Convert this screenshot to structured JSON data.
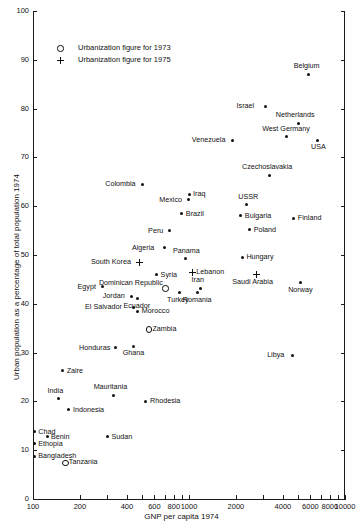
{
  "chart_data": {
    "type": "scatter",
    "title": "",
    "xlabel": "GNP per capita 1974",
    "ylabel": "Urban population as a percentage of total population 1974",
    "xscale": "log",
    "xlim": [
      100,
      10000
    ],
    "ylim": [
      0,
      100
    ],
    "grid": false,
    "xticks": [
      100,
      200,
      400,
      600,
      800,
      1000,
      2000,
      4000,
      6000,
      8000,
      10000
    ],
    "xtick_labels": [
      "100",
      "200",
      "400",
      "600",
      "800",
      "1000",
      "2000",
      "4000",
      "6000",
      "8000",
      "10000"
    ],
    "yticks": [
      0,
      10,
      20,
      30,
      40,
      50,
      60,
      70,
      80,
      90,
      100
    ],
    "ytick_labels": [
      "0",
      "10",
      "20",
      "30",
      "40",
      "50",
      "60",
      "70",
      "80",
      "90",
      "100"
    ],
    "legend": {
      "position": "upper-left-inside",
      "entries": [
        {
          "marker": "circle-open",
          "label": "Urbanization figure for 1973"
        },
        {
          "marker": "plus",
          "label": "Urbanization figure for 1975"
        }
      ]
    },
    "points": [
      {
        "name": "Belgium",
        "x": 5800,
        "y": 87.0,
        "marker": "dot",
        "label_pos": "above"
      },
      {
        "name": "Israel",
        "x": 3100,
        "y": 80.5,
        "marker": "dot",
        "label_pos": "left"
      },
      {
        "name": "Netherlands",
        "x": 5000,
        "y": 77.0,
        "marker": "dot",
        "label_pos": "above"
      },
      {
        "name": "USA",
        "x": 6700,
        "y": 73.5,
        "marker": "dot",
        "label_pos": "below"
      },
      {
        "name": "West Germany",
        "x": 4200,
        "y": 74.2,
        "marker": "dot",
        "label_pos": "above"
      },
      {
        "name": "Venezuela",
        "x": 1900,
        "y": 73.5,
        "marker": "dot",
        "label_pos": "left"
      },
      {
        "name": "Czechoslavakia",
        "x": 3300,
        "y": 66.3,
        "marker": "dot",
        "label_pos": "above"
      },
      {
        "name": "Colombia",
        "x": 500,
        "y": 64.5,
        "marker": "dot",
        "label_pos": "left"
      },
      {
        "name": "Iraq",
        "x": 1000,
        "y": 62.5,
        "marker": "dot",
        "label_pos": "right"
      },
      {
        "name": "Mexico",
        "x": 990,
        "y": 61.3,
        "marker": "dot",
        "label_pos": "left"
      },
      {
        "name": "USSR",
        "x": 2350,
        "y": 60.3,
        "marker": "dot",
        "label_pos": "above"
      },
      {
        "name": "Brazil",
        "x": 900,
        "y": 58.5,
        "marker": "dot",
        "label_pos": "right"
      },
      {
        "name": "Bulgaria",
        "x": 2150,
        "y": 58.0,
        "marker": "dot",
        "label_pos": "right"
      },
      {
        "name": "Finland",
        "x": 4700,
        "y": 57.5,
        "marker": "dot",
        "label_pos": "right"
      },
      {
        "name": "Poland",
        "x": 2450,
        "y": 55.2,
        "marker": "dot",
        "label_pos": "right"
      },
      {
        "name": "Peru",
        "x": 750,
        "y": 55.0,
        "marker": "dot",
        "label_pos": "left"
      },
      {
        "name": "Algeria",
        "x": 700,
        "y": 51.5,
        "marker": "dot",
        "label_pos": "left"
      },
      {
        "name": "Panama",
        "x": 950,
        "y": 49.2,
        "marker": "dot",
        "label_pos": "above"
      },
      {
        "name": "Hungary",
        "x": 2200,
        "y": 49.5,
        "marker": "dot",
        "label_pos": "right"
      },
      {
        "name": "South Korea",
        "x": 480,
        "y": 48.5,
        "marker": "plus",
        "label_pos": "left"
      },
      {
        "name": "Lebanon",
        "x": 1050,
        "y": 46.5,
        "marker": "plus",
        "label_pos": "right"
      },
      {
        "name": "Syria",
        "x": 620,
        "y": 46.0,
        "marker": "dot",
        "label_pos": "right"
      },
      {
        "name": "Saudi Arabia",
        "x": 2700,
        "y": 46.0,
        "marker": "plus",
        "label_pos": "below"
      },
      {
        "name": "Norway",
        "x": 5200,
        "y": 44.3,
        "marker": "dot",
        "label_pos": "below"
      },
      {
        "name": "Egypt",
        "x": 280,
        "y": 43.5,
        "marker": "dot",
        "label_pos": "left"
      },
      {
        "name": "Iran",
        "x": 1180,
        "y": 43.2,
        "marker": "dot",
        "label_pos": "above"
      },
      {
        "name": "Dominican Republic",
        "x": 700,
        "y": 43.2,
        "marker": "circle",
        "label_pos": "left2"
      },
      {
        "name": "Romania",
        "x": 1130,
        "y": 42.3,
        "marker": "dot",
        "label_pos": "below"
      },
      {
        "name": "Turkey",
        "x": 870,
        "y": 42.3,
        "marker": "dot",
        "label_pos": "below"
      },
      {
        "name": "Jordan",
        "x": 430,
        "y": 41.5,
        "marker": "dot",
        "label_pos": "left"
      },
      {
        "name": "Ecuador",
        "x": 470,
        "y": 41.0,
        "marker": "dot",
        "label_pos": "below"
      },
      {
        "name": "El Salvador",
        "x": 440,
        "y": 39.3,
        "marker": "dot",
        "label_pos": "left"
      },
      {
        "name": "Morocco",
        "x": 470,
        "y": 38.5,
        "marker": "dot",
        "label_pos": "right"
      },
      {
        "name": "Zambia",
        "x": 550,
        "y": 34.8,
        "marker": "circle",
        "label_pos": "right"
      },
      {
        "name": "Honduras",
        "x": 340,
        "y": 31.0,
        "marker": "dot",
        "label_pos": "left"
      },
      {
        "name": "Ghana",
        "x": 440,
        "y": 31.3,
        "marker": "dot",
        "label_pos": "below"
      },
      {
        "name": "Libya",
        "x": 4600,
        "y": 29.5,
        "marker": "dot",
        "label_pos": "left"
      },
      {
        "name": "Zaire",
        "x": 155,
        "y": 26.3,
        "marker": "dot",
        "label_pos": "right"
      },
      {
        "name": "Mauritania",
        "x": 330,
        "y": 21.3,
        "marker": "dot",
        "label_pos": "above"
      },
      {
        "name": "India",
        "x": 145,
        "y": 20.5,
        "marker": "dot",
        "label_pos": "above"
      },
      {
        "name": "Rhodesia",
        "x": 530,
        "y": 20.0,
        "marker": "dot",
        "label_pos": "right"
      },
      {
        "name": "Indonesia",
        "x": 170,
        "y": 18.3,
        "marker": "dot",
        "label_pos": "right"
      },
      {
        "name": "Chad",
        "x": 102,
        "y": 13.8,
        "marker": "dot",
        "label_pos": "right"
      },
      {
        "name": "Benin",
        "x": 123,
        "y": 12.8,
        "marker": "dot",
        "label_pos": "right"
      },
      {
        "name": "Sudan",
        "x": 300,
        "y": 12.8,
        "marker": "dot",
        "label_pos": "right"
      },
      {
        "name": "Ethopia",
        "x": 102,
        "y": 11.3,
        "marker": "dot",
        "label_pos": "right"
      },
      {
        "name": "Bangladesh",
        "x": 102,
        "y": 8.8,
        "marker": "dot",
        "label_pos": "right"
      },
      {
        "name": "Tanzania",
        "x": 160,
        "y": 7.5,
        "marker": "circle",
        "label_pos": "right"
      }
    ]
  }
}
